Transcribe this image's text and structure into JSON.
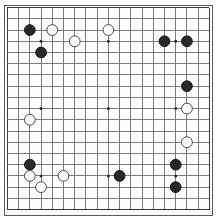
{
  "app": {
    "title": "Go Board Diagram",
    "board_label": "19x19 Go board"
  },
  "board": {
    "size": 19,
    "origin_x": 7.4,
    "origin_y": 7.6,
    "spacing": 11.22,
    "stone_radius": 5.4,
    "star_radius": 1.5,
    "line_color": "#6e6e6e",
    "edge_color": "#3c3c3c",
    "black_color": "#282828",
    "white_color": "#fdfdfd",
    "background_color": "#fdfdfd",
    "star_points": [
      [
        4,
        4
      ],
      [
        10,
        4
      ],
      [
        16,
        4
      ],
      [
        4,
        10
      ],
      [
        10,
        10
      ],
      [
        16,
        10
      ],
      [
        4,
        16
      ],
      [
        10,
        16
      ],
      [
        16,
        16
      ]
    ],
    "column_labels": [
      "A",
      "B",
      "C",
      "D",
      "E",
      "F",
      "G",
      "H",
      "J",
      "K",
      "L",
      "M",
      "N",
      "O",
      "P",
      "Q",
      "R",
      "S",
      "T"
    ],
    "row_labels": [
      "19",
      "18",
      "17",
      "16",
      "15",
      "14",
      "13",
      "12",
      "11",
      "10",
      "9",
      "8",
      "7",
      "6",
      "5",
      "4",
      "3",
      "2",
      "1"
    ]
  },
  "stones": [
    {
      "color": "black",
      "col": 3,
      "row": 3,
      "label": "C17"
    },
    {
      "color": "white",
      "col": 5,
      "row": 3,
      "label": "E17"
    },
    {
      "color": "white",
      "col": 10,
      "row": 3,
      "label": "K17"
    },
    {
      "color": "white",
      "col": 7,
      "row": 4,
      "label": "G16"
    },
    {
      "color": "black",
      "col": 15,
      "row": 4,
      "label": "P16"
    },
    {
      "color": "black",
      "col": 17,
      "row": 4,
      "label": "R16"
    },
    {
      "color": "black",
      "col": 4,
      "row": 5,
      "label": "D15"
    },
    {
      "color": "black",
      "col": 17,
      "row": 8,
      "label": "R12"
    },
    {
      "color": "white",
      "col": 17,
      "row": 10,
      "label": "R10"
    },
    {
      "color": "white",
      "col": 3,
      "row": 11,
      "label": "C9"
    },
    {
      "color": "white",
      "col": 17,
      "row": 13,
      "label": "R7"
    },
    {
      "color": "black",
      "col": 3,
      "row": 15,
      "label": "C5"
    },
    {
      "color": "black",
      "col": 16,
      "row": 15,
      "label": "Q5"
    },
    {
      "color": "white",
      "col": 3,
      "row": 16,
      "label": "C4"
    },
    {
      "color": "white",
      "col": 6,
      "row": 16,
      "label": "F4"
    },
    {
      "color": "black",
      "col": 11,
      "row": 16,
      "label": "L4"
    },
    {
      "color": "white",
      "col": 4,
      "row": 17,
      "label": "D3"
    },
    {
      "color": "black",
      "col": 16,
      "row": 17,
      "label": "Q3"
    }
  ]
}
